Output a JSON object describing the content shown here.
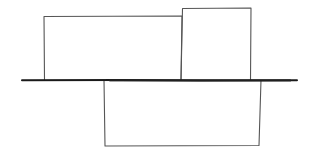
{
  "diagram": {
    "stroke_color": "#555555",
    "baseline_color": "#1a1a1a",
    "baseline": {
      "x1": 22,
      "y": 80,
      "x2": 297
    },
    "boxes": [
      {
        "name": "box-top-left",
        "x": 44,
        "y": 16,
        "w": 138,
        "h": 64
      },
      {
        "name": "box-top-right",
        "x": 182,
        "y": 8,
        "w": 69,
        "h": 72
      },
      {
        "name": "box-bottom",
        "x": 104,
        "y": 80,
        "w": 157,
        "h": 66
      }
    ]
  }
}
